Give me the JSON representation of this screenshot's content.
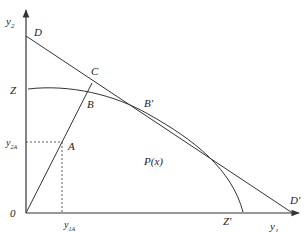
{
  "diagram": {
    "colors": {
      "line": "#333333",
      "background": "#ffffff"
    },
    "axes": {
      "x_label": "y",
      "x_label_sub": "1",
      "y_label": "y",
      "y_label_sub": "2",
      "origin_label": "0"
    },
    "points": {
      "D": "D",
      "C": "C",
      "Z": "Z",
      "B": "B",
      "B_prime": "B'",
      "A": "A",
      "D_prime": "D'",
      "Z_prime": "Z'"
    },
    "region_label": "P(x)",
    "ticks": {
      "y2A_main": "y",
      "y2A_sub": "2A",
      "y1A_main": "y",
      "y1A_sub": "1A"
    }
  }
}
